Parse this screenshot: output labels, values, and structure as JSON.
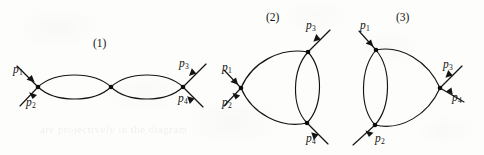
{
  "figure": {
    "kind": "feynman-diagram-set",
    "background_color": "#fdfdfc",
    "ink_color": "#141414",
    "diagram_count": 3
  },
  "diagrams": [
    {
      "id": "diagram-1",
      "number_label": "(1)",
      "number_pos": {
        "x": 93,
        "y": 38
      },
      "topology": "chain of two bubbles (three vertices in a line)",
      "vertices": [
        {
          "name": "left-vertex",
          "x": 38,
          "y": 87
        },
        {
          "name": "middle-vertex",
          "x": 111,
          "y": 87
        },
        {
          "name": "right-vertex",
          "x": 183,
          "y": 87
        }
      ],
      "internal_lines": [
        {
          "from": "left-vertex",
          "to": "middle-vertex",
          "bow": "up"
        },
        {
          "from": "left-vertex",
          "to": "middle-vertex",
          "bow": "down"
        },
        {
          "from": "middle-vertex",
          "to": "right-vertex",
          "bow": "up"
        },
        {
          "from": "middle-vertex",
          "to": "right-vertex",
          "bow": "down"
        }
      ],
      "external_legs": [
        {
          "label": "p",
          "sub": "1",
          "direction": "incoming",
          "attached_to": "left-vertex",
          "label_pos": {
            "x": 13,
            "y": 64
          }
        },
        {
          "label": "p",
          "sub": "2",
          "direction": "incoming",
          "attached_to": "left-vertex",
          "label_pos": {
            "x": 26,
            "y": 97
          }
        },
        {
          "label": "p",
          "sub": "3",
          "direction": "outgoing",
          "attached_to": "right-vertex",
          "label_pos": {
            "x": 179,
            "y": 58
          }
        },
        {
          "label": "p",
          "sub": "4",
          "direction": "outgoing",
          "attached_to": "right-vertex",
          "label_pos": {
            "x": 178,
            "y": 93
          }
        }
      ]
    },
    {
      "id": "diagram-2",
      "number_label": "(2)",
      "number_pos": {
        "x": 266,
        "y": 12
      },
      "topology": "triangle with a doubled right edge (sunset on the right)",
      "vertices": [
        {
          "name": "left-vertex",
          "x": 241,
          "y": 88
        },
        {
          "name": "top-vertex",
          "x": 308,
          "y": 52
        },
        {
          "name": "bottom-vertex",
          "x": 307,
          "y": 123
        }
      ],
      "internal_lines": [
        {
          "from": "left-vertex",
          "to": "top-vertex",
          "bow": "up"
        },
        {
          "from": "left-vertex",
          "to": "bottom-vertex",
          "bow": "down"
        },
        {
          "from": "top-vertex",
          "to": "bottom-vertex",
          "bow": "left"
        },
        {
          "from": "top-vertex",
          "to": "bottom-vertex",
          "bow": "right"
        }
      ],
      "external_legs": [
        {
          "label": "p",
          "sub": "1",
          "direction": "incoming",
          "attached_to": "left-vertex",
          "label_pos": {
            "x": 222,
            "y": 62
          }
        },
        {
          "label": "p",
          "sub": "2",
          "direction": "incoming",
          "attached_to": "left-vertex",
          "label_pos": {
            "x": 222,
            "y": 97
          }
        },
        {
          "label": "p",
          "sub": "3",
          "direction": "outgoing",
          "attached_to": "top-vertex",
          "label_pos": {
            "x": 306,
            "y": 20
          }
        },
        {
          "label": "p",
          "sub": "4",
          "direction": "outgoing",
          "attached_to": "bottom-vertex",
          "label_pos": {
            "x": 306,
            "y": 133
          }
        }
      ]
    },
    {
      "id": "diagram-3",
      "number_label": "(3)",
      "number_pos": {
        "x": 396,
        "y": 12
      },
      "topology": "triangle with a doubled left edge (sunset on the left)",
      "vertices": [
        {
          "name": "top-vertex",
          "x": 376,
          "y": 50
        },
        {
          "name": "bottom-vertex",
          "x": 375,
          "y": 125
        },
        {
          "name": "right-vertex",
          "x": 440,
          "y": 88
        }
      ],
      "internal_lines": [
        {
          "from": "top-vertex",
          "to": "bottom-vertex",
          "bow": "left"
        },
        {
          "from": "top-vertex",
          "to": "bottom-vertex",
          "bow": "right"
        },
        {
          "from": "top-vertex",
          "to": "right-vertex",
          "bow": "up"
        },
        {
          "from": "bottom-vertex",
          "to": "right-vertex",
          "bow": "down"
        }
      ],
      "external_legs": [
        {
          "label": "p",
          "sub": "1",
          "direction": "incoming",
          "attached_to": "top-vertex",
          "label_pos": {
            "x": 360,
            "y": 20
          }
        },
        {
          "label": "p",
          "sub": "2",
          "direction": "incoming",
          "attached_to": "bottom-vertex",
          "label_pos": {
            "x": 375,
            "y": 133
          }
        },
        {
          "label": "p",
          "sub": "3",
          "direction": "outgoing",
          "attached_to": "right-vertex",
          "label_pos": {
            "x": 443,
            "y": 59
          }
        },
        {
          "label": "p",
          "sub": "4",
          "direction": "outgoing",
          "attached_to": "right-vertex",
          "label_pos": {
            "x": 452,
            "y": 92
          }
        }
      ]
    }
  ],
  "labels": {
    "d1_num": "(1)",
    "d2_num": "(2)",
    "d3_num": "(3)",
    "p": "p",
    "s1": "1",
    "s2": "2",
    "s3": "3",
    "s4": "4"
  },
  "bleed_through_text": {
    "line1": "are projectively in the diagram",
    "line2": "rendered faintly from the reverse page"
  }
}
